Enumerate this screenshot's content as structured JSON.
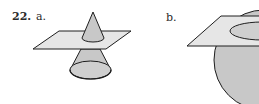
{
  "problem": {
    "number": "22.",
    "parts": [
      {
        "label": "a.",
        "figure": "cone-intersected-by-plane"
      },
      {
        "label": "b.",
        "figure": "sphere-intersected-by-plane"
      }
    ]
  },
  "colors": {
    "plane_fill": "#e6e6e6",
    "solid_fill": "#c8c8c8",
    "stroke": "#1e1e1e",
    "background": "#ffffff"
  }
}
